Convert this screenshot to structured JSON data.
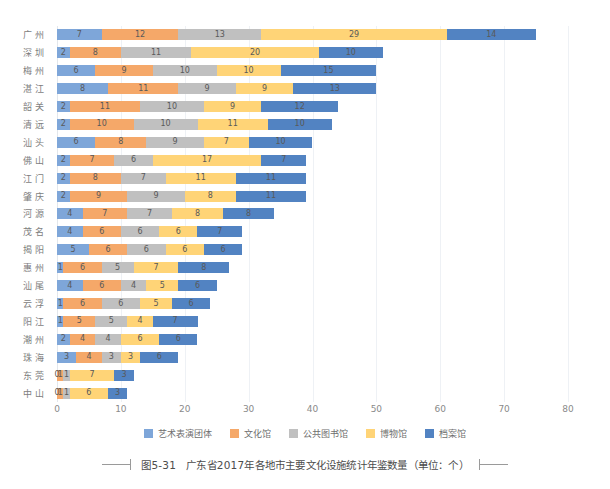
{
  "chart_data": {
    "type": "bar",
    "orientation": "horizontal",
    "stacked": true,
    "title": "图5-31　广东省2017年各地市主要文化设施统计年鉴数量（单位：个）",
    "xlabel": "",
    "ylabel": "",
    "xlim": [
      0,
      80
    ],
    "xticks": [
      "0",
      "10",
      "20",
      "30",
      "40",
      "50",
      "60",
      "70",
      "80"
    ],
    "grid": true,
    "grid_axis": "x",
    "legend_position": "bottom",
    "categories": [
      "广州",
      "深圳",
      "梅州",
      "湛江",
      "韶关",
      "清远",
      "汕头",
      "佛山",
      "江门",
      "肇庆",
      "河源",
      "茂名",
      "揭阳",
      "惠州",
      "汕尾",
      "云浮",
      "阳江",
      "潮州",
      "珠海",
      "东莞",
      "中山"
    ],
    "series": [
      {
        "name": "艺术表演团体",
        "color": "#7ea6d9",
        "values": [
          7,
          2,
          6,
          8,
          2,
          2,
          6,
          2,
          2,
          2,
          4,
          4,
          5,
          1,
          4,
          1,
          1,
          2,
          3,
          0,
          0
        ]
      },
      {
        "name": "文化馆",
        "color": "#f5a869",
        "values": [
          12,
          8,
          9,
          11,
          11,
          10,
          8,
          7,
          8,
          9,
          7,
          6,
          6,
          6,
          6,
          6,
          5,
          4,
          4,
          1,
          1
        ]
      },
      {
        "name": "公共图书馆",
        "color": "#c0c0c0",
        "values": [
          13,
          11,
          10,
          9,
          10,
          10,
          9,
          6,
          7,
          9,
          7,
          6,
          6,
          5,
          4,
          6,
          5,
          4,
          3,
          1,
          1
        ]
      },
      {
        "name": "博物馆",
        "color": "#ffd477",
        "values": [
          29,
          20,
          10,
          9,
          9,
          11,
          7,
          17,
          11,
          8,
          8,
          6,
          6,
          7,
          5,
          5,
          4,
          6,
          3,
          7,
          6
        ]
      },
      {
        "name": "档案馆",
        "color": "#5283c2",
        "values": [
          14,
          10,
          15,
          13,
          12,
          10,
          10,
          7,
          11,
          11,
          8,
          7,
          6,
          8,
          6,
          6,
          7,
          6,
          6,
          3,
          3
        ]
      }
    ],
    "totals": [
      75,
      51,
      50,
      50,
      44,
      43,
      40,
      39,
      39,
      39,
      34,
      29,
      29,
      27,
      25,
      24,
      22,
      22,
      19,
      12,
      11
    ]
  },
  "legend": {
    "items": [
      {
        "label": "艺术表演团体",
        "color": "#7ea6d9"
      },
      {
        "label": "文化馆",
        "color": "#f5a869"
      },
      {
        "label": "公共图书馆",
        "color": "#c0c0c0"
      },
      {
        "label": "博物馆",
        "color": "#ffd477"
      },
      {
        "label": "档案馆",
        "color": "#5283c2"
      }
    ]
  },
  "caption": {
    "text": "图5-31　广东省2017年各地市主要文化设施统计年鉴数量（单位：个）"
  }
}
